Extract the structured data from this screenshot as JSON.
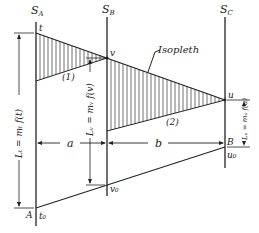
{
  "scales": {
    "a": {
      "name": "S",
      "subscript": "A"
    },
    "b": {
      "name": "S",
      "subscript": "B"
    },
    "c": {
      "name": "S",
      "subscript": "C"
    }
  },
  "points": {
    "t": "t",
    "v": "v",
    "u": "u",
    "t0": "t₀",
    "v0": "v₀",
    "u0": "u₀",
    "A": "A",
    "B": "B"
  },
  "labels": {
    "isopleth": "Isopleth",
    "triangle1": "(1)",
    "triangle2": "(2)",
    "dist_a": "a",
    "dist_b": "b",
    "len_t": "Lₜ = mₜ f(t)",
    "len_v": "Lᵥ = mᵥ f(v)",
    "len_u": "Lᵤ = mᵤ f(u)"
  }
}
